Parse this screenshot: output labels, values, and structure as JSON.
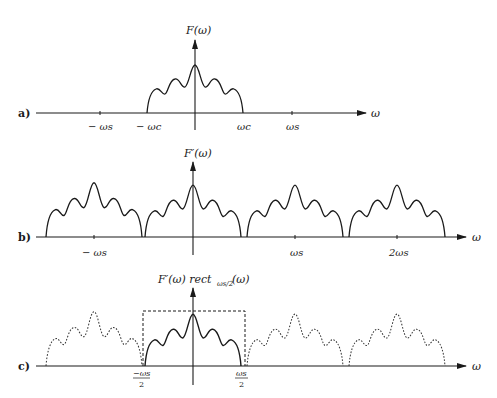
{
  "diagram": {
    "panels": [
      {
        "id": "a",
        "label": "a)",
        "y_axis_label": "F(ω)",
        "x_axis_label": "ω",
        "ticks": [
          "− ωs",
          "− ωc",
          "ωc",
          "ωs"
        ],
        "description": "Band-limited spectrum F(ω), nonzero between −ωc and ωc"
      },
      {
        "id": "b",
        "label": "b)",
        "y_axis_label": "F′(ω)",
        "x_axis_label": "ω",
        "ticks": [
          "− ωs",
          "ωs",
          "2ωs"
        ],
        "description": "Periodic spectrum of sampled signal, replicas spaced by ωs"
      },
      {
        "id": "c",
        "label": "c)",
        "y_axis_label": "F′(ω) rect",
        "y_axis_sub": "ωs/2",
        "y_axis_tail": "(ω)",
        "x_axis_label": "ω",
        "ticks": [
          "−ωs/2",
          "ωs/2"
        ],
        "tick_left_num": "−ωs",
        "tick_right_num": "ωs",
        "tick_den": "2",
        "description": "Ideal low-pass filter (dashed rect) isolates central replica; other replicas dotted"
      }
    ]
  }
}
